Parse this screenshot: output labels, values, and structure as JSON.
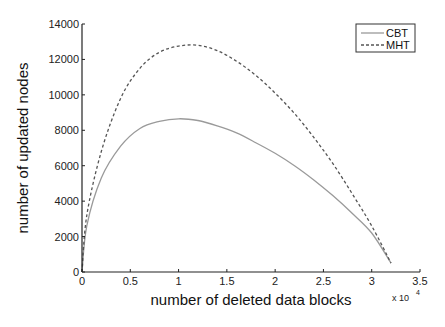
{
  "chart_data": {
    "type": "line",
    "title": "",
    "xlabel": "number of deleted data blocks",
    "ylabel": "number of updated nodes",
    "x_multiplier_label": "x 10",
    "x_multiplier_exponent": "4",
    "xlim": [
      0,
      3.5
    ],
    "ylim": [
      0,
      14000
    ],
    "x_ticks": [
      0,
      0.5,
      1,
      1.5,
      2,
      2.5,
      3,
      3.5
    ],
    "x_tick_labels": [
      "0",
      "0.5",
      "1",
      "1.5",
      "2",
      "2.5",
      "3",
      "3.5"
    ],
    "y_ticks": [
      0,
      2000,
      4000,
      6000,
      8000,
      10000,
      12000,
      14000
    ],
    "y_tick_labels": [
      "0",
      "2000",
      "4000",
      "6000",
      "8000",
      "10000",
      "12000",
      "14000"
    ],
    "grid": false,
    "legend_position": "upper right",
    "x": [
      0,
      0.05,
      0.2,
      0.4,
      0.6,
      0.8,
      1.0,
      1.2,
      1.4,
      1.6,
      1.8,
      2.0,
      2.2,
      2.4,
      2.6,
      2.8,
      3.0,
      3.2
    ],
    "series": [
      {
        "name": "CBT",
        "style": "solid",
        "color": "#9a9a9a",
        "values": [
          0,
          2600,
          5300,
          7100,
          8100,
          8500,
          8650,
          8550,
          8250,
          7850,
          7300,
          6700,
          6000,
          5200,
          4300,
          3300,
          2200,
          500
        ]
      },
      {
        "name": "MHT",
        "style": "dashed",
        "color": "#555555",
        "values": [
          0,
          3200,
          6800,
          9800,
          11500,
          12400,
          12750,
          12800,
          12500,
          11900,
          11100,
          10100,
          8950,
          7600,
          6100,
          4400,
          2600,
          500
        ]
      }
    ]
  },
  "legend": {
    "items": [
      {
        "label": "CBT",
        "style": "solid"
      },
      {
        "label": "MHT",
        "style": "dashed"
      }
    ]
  }
}
